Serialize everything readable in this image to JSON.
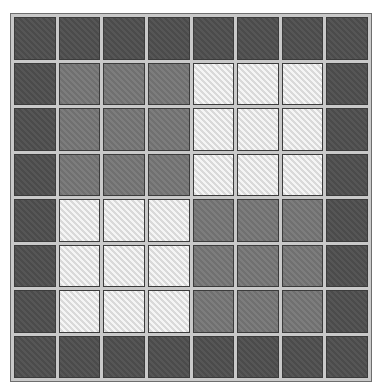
{
  "board": {
    "rows": 8,
    "cols": 8,
    "colors": {
      "dark": "#4f4f4f",
      "medium": "#767676",
      "light": "#e6e6e6",
      "grid_line": "#c9c9c9",
      "cell_border": "#3c3c3c"
    },
    "cells": [
      [
        "dark",
        "dark",
        "dark",
        "dark",
        "dark",
        "dark",
        "dark",
        "dark"
      ],
      [
        "dark",
        "medium",
        "medium",
        "medium",
        "light",
        "light",
        "light",
        "dark"
      ],
      [
        "dark",
        "medium",
        "medium",
        "medium",
        "light",
        "light",
        "light",
        "dark"
      ],
      [
        "dark",
        "medium",
        "medium",
        "medium",
        "light",
        "light",
        "light",
        "dark"
      ],
      [
        "dark",
        "light",
        "light",
        "light",
        "medium",
        "medium",
        "medium",
        "dark"
      ],
      [
        "dark",
        "light",
        "light",
        "light",
        "medium",
        "medium",
        "medium",
        "dark"
      ],
      [
        "dark",
        "light",
        "light",
        "light",
        "medium",
        "medium",
        "medium",
        "dark"
      ],
      [
        "dark",
        "dark",
        "dark",
        "dark",
        "dark",
        "dark",
        "dark",
        "dark"
      ]
    ]
  }
}
